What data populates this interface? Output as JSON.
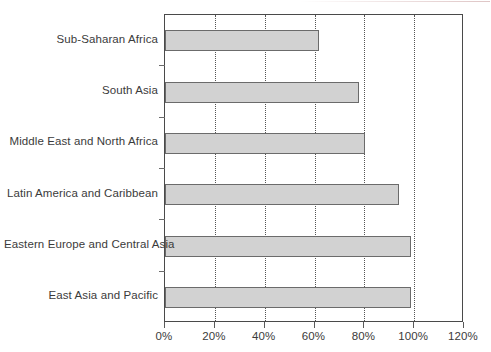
{
  "chart_data": {
    "type": "bar",
    "orientation": "horizontal",
    "title": "",
    "subtitle": "",
    "xlabel": "",
    "ylabel": "",
    "categories": [
      "Sub-Saharan Africa",
      "South Asia",
      "Middle East and North Africa",
      "Latin America and Caribbean",
      "Eastern Europe and Central Asia",
      "East Asia and Pacific"
    ],
    "values": [
      61.8,
      78.0,
      80.3,
      94.0,
      98.7,
      98.7
    ],
    "value_unit": "%",
    "xlim": [
      0,
      120
    ],
    "xticks": [
      0,
      20,
      40,
      60,
      80,
      100,
      120
    ],
    "xticklabels": [
      "0%",
      "20%",
      "40%",
      "60%",
      "80%",
      "100%",
      "120%"
    ],
    "grid": "vertical-dotted",
    "legend": "none",
    "series": [
      {
        "name": "",
        "values": [
          61.8,
          78.0,
          80.3,
          94.0,
          98.7,
          98.7
        ]
      }
    ],
    "colors": {
      "bar_fill": "#d2d2d2",
      "bar_border": "#6b6b6b",
      "axis": "#4a4a4a",
      "gridline": "#555555",
      "text": "#3b3b3b",
      "background": "#ffffff"
    }
  }
}
